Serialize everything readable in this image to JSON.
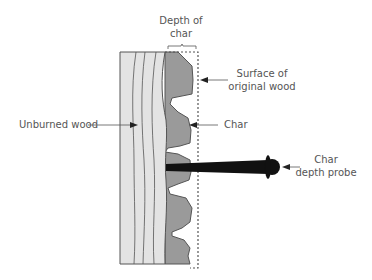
{
  "diagram": {
    "labels": {
      "depth_of_char_line1": "Depth of",
      "depth_of_char_line2": "char",
      "surface_line1": "Surface of",
      "surface_line2": "original wood",
      "unburned_wood": "Unburned wood",
      "char": "Char",
      "probe_line1": "Char",
      "probe_line2": "depth probe"
    },
    "colors": {
      "unburned_wood": "#e3e3e3",
      "char": "#9a9a9a",
      "outline": "#555555",
      "probe": "#111111",
      "text": "#555555"
    }
  }
}
